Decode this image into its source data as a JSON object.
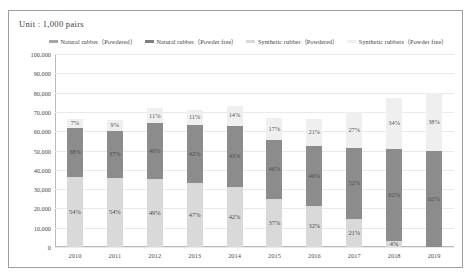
{
  "unit_note": "Unit : 1,000  pairs",
  "legend": [
    {
      "label": "Natural rubber（Powdered）",
      "color": "#a6a6a6",
      "key": "natural_powdered"
    },
    {
      "label": "Natural rubber（Powder free）",
      "color": "#808080",
      "key": "natural_powder_free"
    },
    {
      "label": "Synthetic rubber（Powdered）",
      "color": "#d9d9d9",
      "key": "synthetic_powdered"
    },
    {
      "label": "Synthetic rubbers（Powder free）",
      "color": "#efefef",
      "key": "synthetic_powder_free"
    }
  ],
  "chart_data": {
    "type": "bar",
    "stacked": true,
    "title": "",
    "xlabel": "",
    "ylabel": "",
    "unit": "1,000 pairs",
    "ylim": [
      0,
      100000
    ],
    "ytick_labels": [
      "100,000",
      "90,000",
      "80,000",
      "70,000",
      "60,000",
      "50,000",
      "40,000",
      "30,000",
      "20,000",
      "10,000",
      "0"
    ],
    "ytick_values": [
      100000,
      90000,
      80000,
      70000,
      60000,
      50000,
      40000,
      30000,
      20000,
      10000,
      0
    ],
    "grid": true,
    "legend_position": "top",
    "categories": [
      "2010",
      "2011",
      "2012",
      "2013",
      "2014",
      "2015",
      "2016",
      "2017",
      "2018",
      "2019"
    ],
    "totals": [
      67000,
      66000,
      72000,
      71000,
      74000,
      67000,
      67000,
      70000,
      77000,
      80000
    ],
    "series": [
      {
        "name": "Synthetic rubber（Powdered）",
        "color": "#d9d9d9",
        "values": [
          54,
          54,
          49,
          47,
          42,
          37,
          32,
          21,
          4,
          0
        ],
        "labels": [
          "54%",
          "54%",
          "49%",
          "47%",
          "42%",
          "37%",
          "32%",
          "21%",
          "4%",
          ""
        ]
      },
      {
        "name": "Synthetic rubbers（Powder free）",
        "color": "#8c8c8c",
        "values": [
          38,
          37,
          40,
          42,
          43,
          46,
          46,
          52,
          62,
          62
        ],
        "labels": [
          "38%",
          "37%",
          "40%",
          "42%",
          "43%",
          "46%",
          "46%",
          "52%",
          "62%",
          "62%"
        ]
      },
      {
        "name": "Natural rubber（Powder free）",
        "color": "#efefef",
        "values": [
          7,
          9,
          11,
          11,
          14,
          17,
          21,
          27,
          34,
          38
        ],
        "labels": [
          "7%",
          "9%",
          "11%",
          "11%",
          "14%",
          "17%",
          "21%",
          "27%",
          "34%",
          "38%"
        ]
      }
    ]
  }
}
